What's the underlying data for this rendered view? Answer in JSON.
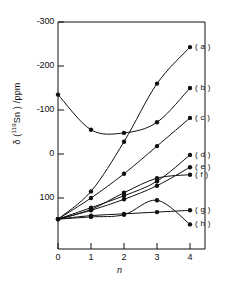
{
  "chart_data": {
    "type": "line",
    "title": "",
    "xlabel": "n",
    "ylabel": "δ (119Sn) /ppm",
    "ylabel_prefix": "δ (",
    "ylabel_sup": "119",
    "ylabel_suffix": "Sn ) /ppm",
    "x": [
      0,
      1,
      2,
      3,
      4
    ],
    "xtick_labels": [
      "0",
      "1",
      "2",
      "3",
      "4"
    ],
    "ytick_labels": [
      "-300",
      "-200",
      "-100",
      "0",
      "100"
    ],
    "ytick_values": [
      -300,
      -200,
      -100,
      0,
      100
    ],
    "ylim": [
      -300,
      160
    ],
    "xlim": [
      -0.35,
      4.45
    ],
    "y_axis_inverted": true,
    "grid": false,
    "legend_position": "right-of-curve-ends",
    "marker": "filled-circle",
    "series": [
      {
        "name": "( a )",
        "label": "( a )",
        "values": [
          148,
          85,
          -28,
          -160,
          -243
        ]
      },
      {
        "name": "( b )",
        "label": "( b )",
        "values": [
          -135,
          -55,
          -48,
          -72,
          -150
        ]
      },
      {
        "name": "( c )",
        "label": "( c )",
        "values": [
          148,
          100,
          45,
          -18,
          -82
        ]
      },
      {
        "name": "( d )",
        "label": "( d )",
        "values": [
          148,
          122,
          95,
          62,
          2
        ]
      },
      {
        "name": "( e )",
        "label": "( e )",
        "values": [
          148,
          128,
          103,
          72,
          30
        ]
      },
      {
        "name": "( f )",
        "label": "( f )",
        "values": [
          148,
          126,
          88,
          55,
          47
        ]
      },
      {
        "name": "( g )",
        "label": "( g )",
        "values": [
          148,
          140,
          136,
          132,
          128
        ]
      },
      {
        "name": "( h )",
        "label": "( h )",
        "values": [
          148,
          143,
          138,
          105,
          160
        ]
      }
    ]
  },
  "axes": {
    "y_title_full": "δ (119Sn ) /ppm",
    "x_title": "n"
  }
}
